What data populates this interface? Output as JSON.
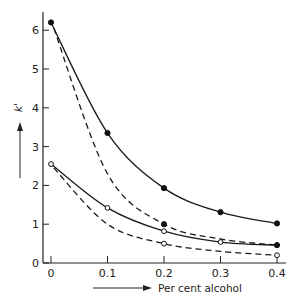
{
  "chart_data": {
    "type": "line",
    "title": "",
    "xlabel": "Per cent alcohol",
    "ylabel": "k'",
    "xlim": [
      0,
      0.4
    ],
    "ylim": [
      0,
      6.4
    ],
    "x_ticks": [
      0,
      0.1,
      0.2,
      0.3,
      0.4
    ],
    "x_tick_labels": [
      "0",
      "0.1",
      "0.2",
      "0.3",
      "0.4"
    ],
    "y_ticks": [
      0,
      1,
      2,
      3,
      4,
      5,
      6
    ],
    "y_tick_labels": [
      "0",
      "1",
      "2",
      "3",
      "4",
      "5",
      "6"
    ],
    "grid": false,
    "legend": null,
    "series": [
      {
        "name": "filled-solid",
        "line": "solid",
        "marker": "filled-circle",
        "x": [
          0,
          0.1,
          0.2,
          0.3,
          0.4
        ],
        "values": [
          6.2,
          3.35,
          1.93,
          1.31,
          1.02
        ]
      },
      {
        "name": "filled-dashed",
        "line": "dashed",
        "marker": "filled-circle",
        "x": [
          0.005,
          0.1,
          0.2,
          0.3,
          0.4
        ],
        "values": [
          6.05,
          2.3,
          1.0,
          0.62,
          0.46
        ],
        "marker_at": [
          0.2,
          0.4
        ]
      },
      {
        "name": "open-solid",
        "line": "solid",
        "marker": "open-circle",
        "x": [
          0,
          0.1,
          0.2,
          0.3,
          0.4
        ],
        "values": [
          2.55,
          1.42,
          0.82,
          0.54,
          0.46
        ],
        "marker_at": [
          0,
          0.1,
          0.2,
          0.3
        ]
      },
      {
        "name": "open-dashed",
        "line": "dashed",
        "marker": "open-circle",
        "x": [
          0.005,
          0.1,
          0.2,
          0.3,
          0.4
        ],
        "values": [
          2.45,
          1.0,
          0.5,
          0.3,
          0.2
        ],
        "marker_at": [
          0.2,
          0.4
        ]
      }
    ]
  },
  "axes": {
    "x_label": "Per cent alcohol",
    "y_label": "k'"
  }
}
